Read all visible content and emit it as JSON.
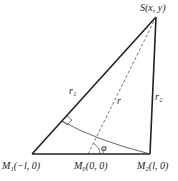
{
  "diagram": {
    "points": {
      "S": {
        "label": "S(x, y)",
        "x": 156,
        "y": 17
      },
      "M1": {
        "label": "M₁(−l, 0)",
        "x": 32,
        "y": 154
      },
      "M0": {
        "label": "M₀(0, 0)",
        "x": 88,
        "y": 154
      },
      "M2": {
        "label": "M₂(l, 0)",
        "x": 150,
        "y": 154
      }
    },
    "segments": {
      "r1": {
        "label": "r₁"
      },
      "r": {
        "label": "r"
      },
      "r2": {
        "label": "r₂"
      }
    },
    "angle": {
      "label": "φ"
    },
    "colors": {
      "line": "#222222",
      "dashed": "#555555",
      "arc": "#444444"
    }
  }
}
